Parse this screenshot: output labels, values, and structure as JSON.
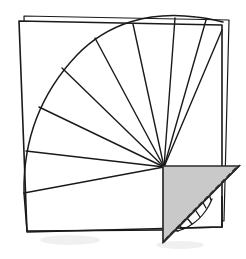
{
  "figure": {
    "type": "geometric-line-diagram",
    "canvas": {
      "width": 246,
      "height": 259
    },
    "background_color": "#ffffff",
    "stroke_color": "#1a1a1a",
    "shade_color": "#c9c9c9",
    "shade_stroke_color": "#2b2b2b",
    "dashed_stroke_color": "#2b2b2b",
    "stroke_width": 1.3,
    "label": ""
  },
  "outer_square_back": {
    "name": "back-square-outline",
    "points": "24,16 229,20 224,221 28,219",
    "fill": "#ffffff",
    "stroke": "#1a1a1a"
  },
  "outer_square_front": {
    "name": "front-square-outline",
    "points": "19,21 222,25 222,227 27,232",
    "fill": "#ffffff",
    "stroke": "#1a1a1a"
  },
  "fan": {
    "name": "segment-fan",
    "apex": {
      "x": 164,
      "y": 167
    },
    "radius": 152,
    "segment_count": 10,
    "start_angle_deg": 180,
    "end_angle_deg": 272,
    "outer_arc_path": "M 24,192 C 24,120 58,58 110,28 C 150,5 186,12 223,22",
    "rays": [
      "M 164,167 L 24,192",
      "M 164,167 L 28,152",
      "M 164,167 L 38,110",
      "M 164,167 L 60,70",
      "M 164,167 L 93,37",
      "M 164,167 L 133,23",
      "M 164,167 L 175,19",
      "M 164,167 L 209,22"
    ]
  },
  "inner_fan": {
    "name": "inner-small-segment-fan",
    "apex": {
      "x": 164,
      "y": 167
    },
    "segment_count": 6,
    "arc_path": "M 180,232 C 196,228 209,214 214,196",
    "rays": [
      "M 164,167 L 180,232",
      "M 164,167 L 192,227",
      "M 164,167 L 202,219",
      "M 164,167 L 209,208",
      "M 164,167 L 213,197"
    ],
    "baseline_path": "M 164,232 L 180,232"
  },
  "shaded_triangle": {
    "name": "shaded-right-triangle",
    "points": "163,166 239,166 163,242",
    "fill": "#c9c9c9",
    "stroke": "#2b2b2b",
    "right_angle_vertex": {
      "x": 163,
      "y": 166
    },
    "hypotenuse_dashed": true,
    "dash_pattern": "5 3"
  },
  "dashed_hypotenuse": {
    "name": "dashed-hypotenuse",
    "path": "M 239,166 L 163,242",
    "dash": "5,3",
    "stroke": "#2b2b2b"
  },
  "corner_detail": {
    "name": "square-corner-detail",
    "path": "M 222,196 L 222,227 L 180,227"
  }
}
